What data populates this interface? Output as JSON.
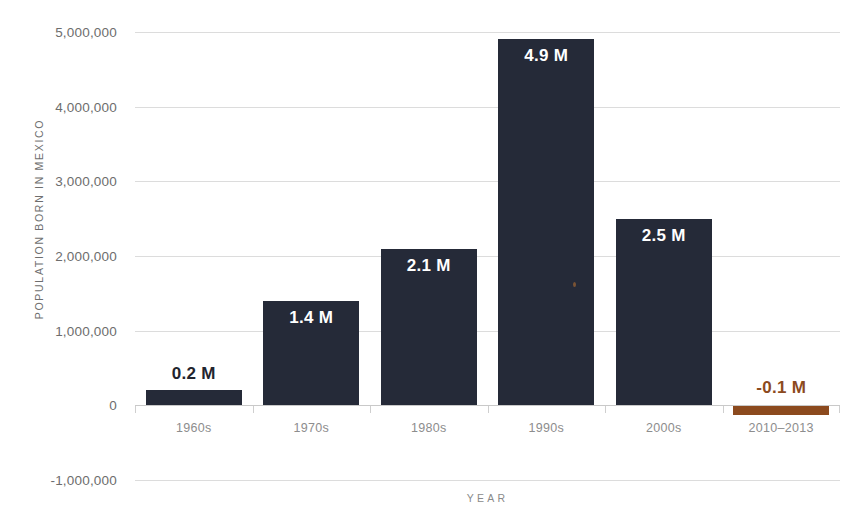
{
  "chart_data": {
    "type": "bar",
    "title": "",
    "xlabel": "YEAR",
    "ylabel": "POPULATION BORN IN MEXICO",
    "categories": [
      "1960s",
      "1970s",
      "1980s",
      "1990s",
      "2000s",
      "2010–2013"
    ],
    "values": [
      200000,
      1400000,
      2100000,
      4900000,
      2500000,
      -100000
    ],
    "data_labels": [
      "0.2 M",
      "1.4 M",
      "2.1 M",
      "4.9 M",
      "2.5 M",
      "-0.1 M"
    ],
    "ylim": [
      -1000000,
      5000000
    ],
    "ytick_labels": [
      "5,000,000",
      "4,000,000",
      "3,000,000",
      "2,000,000",
      "1,000,000",
      "0",
      "-1,000,000"
    ],
    "ytick_values": [
      5000000,
      4000000,
      3000000,
      2000000,
      1000000,
      0,
      -1000000
    ],
    "grid": true,
    "legend": "none",
    "series": [
      {
        "name": "Population born in Mexico",
        "values": [
          200000,
          1400000,
          2100000,
          4900000,
          2500000,
          -100000
        ]
      }
    ],
    "colors": {
      "bar": "#252a38",
      "bar_negative": "#8c4a1e",
      "gridline": "#dcdcdc",
      "axis_text": "#6d6d6d",
      "label_inside": "#ffffff",
      "label_outside": "#22242e",
      "background": "#ffffff"
    }
  }
}
